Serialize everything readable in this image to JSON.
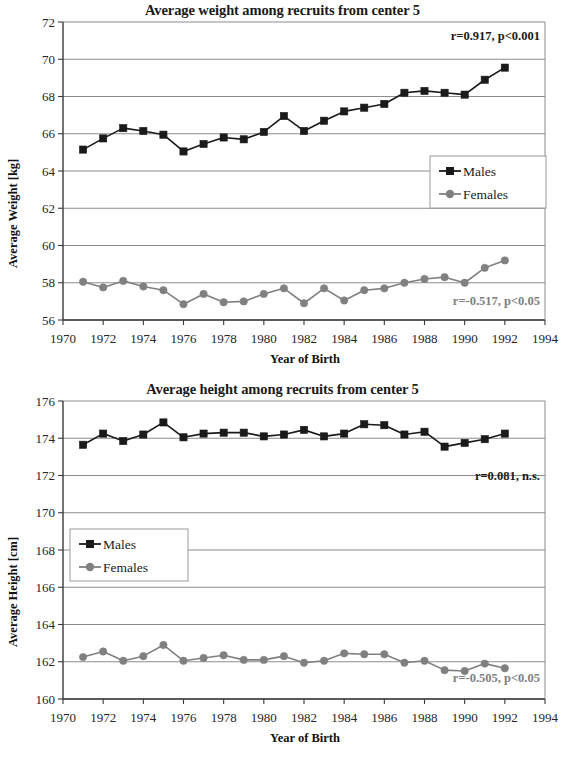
{
  "figures": [
    {
      "id": "weight",
      "title": "Average weight among recruits from center 5",
      "xlabel": "Year of Birth",
      "ylabel": "Average Weight [kg]",
      "legend": {
        "males": "Males",
        "females": "Females"
      },
      "annotations": {
        "males": "r=0.917, p<0.001",
        "females": "r=-0.517, p<0.05"
      },
      "ticks": {
        "y": [
          "56",
          "58",
          "60",
          "62",
          "64",
          "66",
          "68",
          "70",
          "72"
        ],
        "x": [
          "1970",
          "1972",
          "1974",
          "1976",
          "1978",
          "1980",
          "1982",
          "1984",
          "1986",
          "1988",
          "1990",
          "1992",
          "1994"
        ]
      }
    },
    {
      "id": "height",
      "title": "Average height among recruits from center 5",
      "xlabel": "Year of Birth",
      "ylabel": "Average Height [cm]",
      "legend": {
        "males": "Males",
        "females": "Females"
      },
      "annotations": {
        "males": "r=0.081, n.s.",
        "females": "r=-0.505, p<0.05"
      },
      "ticks": {
        "y": [
          "160",
          "162",
          "164",
          "166",
          "168",
          "170",
          "172",
          "174",
          "176"
        ],
        "x": [
          "1970",
          "1972",
          "1974",
          "1976",
          "1978",
          "1980",
          "1982",
          "1984",
          "1986",
          "1988",
          "1990",
          "1992",
          "1994"
        ]
      }
    }
  ],
  "colors": {
    "males": "#1a1a1a",
    "females": "#808080",
    "grid": "#808080",
    "axis": "#3a3a3a",
    "background": "#ffffff"
  },
  "chart_data": [
    {
      "type": "line",
      "title": "Average weight among recruits from center 5",
      "xlabel": "Year of Birth",
      "ylabel": "Average Weight [kg]",
      "xlim": [
        1970,
        1994
      ],
      "ylim": [
        56,
        72
      ],
      "ytick_step": 2,
      "xtick_step": 2,
      "grid": true,
      "legend_position": "right-middle",
      "annotations": [
        {
          "series": "Males",
          "text": "r=0.917, p<0.001",
          "r": 0.917,
          "p": "<0.001"
        },
        {
          "series": "Females",
          "text": "r=-0.517, p<0.05",
          "r": -0.517,
          "p": "<0.05"
        }
      ],
      "x": [
        1971,
        1972,
        1973,
        1974,
        1975,
        1976,
        1977,
        1978,
        1979,
        1980,
        1981,
        1982,
        1983,
        1984,
        1985,
        1986,
        1987,
        1988,
        1989,
        1990,
        1991,
        1992
      ],
      "series": [
        {
          "name": "Males",
          "marker": "square",
          "color": "#1a1a1a",
          "values": [
            65.15,
            65.75,
            66.3,
            66.15,
            65.95,
            65.05,
            65.45,
            65.8,
            65.7,
            66.1,
            66.95,
            66.15,
            66.7,
            67.2,
            67.4,
            67.6,
            68.2,
            68.3,
            68.2,
            68.1,
            68.9,
            69.55
          ]
        },
        {
          "name": "Females",
          "marker": "circle",
          "color": "#808080",
          "values": [
            58.05,
            57.75,
            58.1,
            57.8,
            57.6,
            56.85,
            57.4,
            56.95,
            57.0,
            57.4,
            57.7,
            56.9,
            57.7,
            57.05,
            57.6,
            57.7,
            58.0,
            58.2,
            58.3,
            58.0,
            58.8,
            59.2
          ]
        }
      ]
    },
    {
      "type": "line",
      "title": "Average height among recruits from center 5",
      "xlabel": "Year of Birth",
      "ylabel": "Average Height [cm]",
      "xlim": [
        1970,
        1994
      ],
      "ylim": [
        160,
        176
      ],
      "ytick_step": 2,
      "xtick_step": 2,
      "grid": true,
      "legend_position": "left-middle",
      "annotations": [
        {
          "series": "Males",
          "text": "r=0.081, n.s.",
          "r": 0.081,
          "p": "n.s."
        },
        {
          "series": "Females",
          "text": "r=-0.505, p<0.05",
          "r": -0.505,
          "p": "<0.05"
        }
      ],
      "x": [
        1971,
        1972,
        1973,
        1974,
        1975,
        1976,
        1977,
        1978,
        1979,
        1980,
        1981,
        1982,
        1983,
        1984,
        1985,
        1986,
        1987,
        1988,
        1989,
        1990,
        1991,
        1992
      ],
      "series": [
        {
          "name": "Males",
          "marker": "square",
          "color": "#1a1a1a",
          "values": [
            173.65,
            174.25,
            173.85,
            174.2,
            174.85,
            174.05,
            174.25,
            174.3,
            174.3,
            174.1,
            174.2,
            174.45,
            174.1,
            174.25,
            174.75,
            174.7,
            174.2,
            174.35,
            173.55,
            173.75,
            173.95,
            174.25
          ]
        },
        {
          "name": "Females",
          "marker": "circle",
          "color": "#808080",
          "values": [
            162.25,
            162.55,
            162.05,
            162.3,
            162.9,
            162.05,
            162.2,
            162.35,
            162.1,
            162.1,
            162.3,
            161.95,
            162.05,
            162.45,
            162.4,
            162.4,
            161.95,
            162.05,
            161.55,
            161.5,
            161.9,
            161.65
          ]
        }
      ]
    }
  ]
}
